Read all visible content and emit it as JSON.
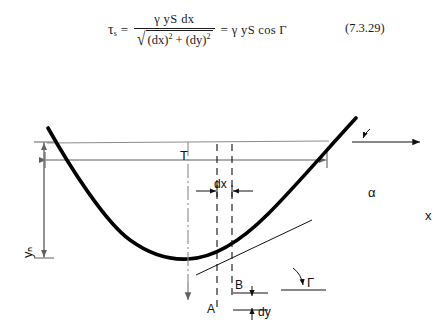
{
  "equation": {
    "lhs_symbol": "τ",
    "lhs_subscript": "s",
    "equals": "=",
    "numerator": "γ yS dx",
    "denominator_radical": "√",
    "denominator_terms": "(dx)² + (dy)²",
    "den_open_a": "(dx)",
    "den_pow_a": "2",
    "den_plus": "+",
    "den_open_b": "(dy)",
    "den_pow_b": "2",
    "equals_2": "=",
    "rhs": "γ yS cos Γ",
    "number": "(7.3.29)"
  },
  "figure": {
    "labels": {
      "top_width": "T",
      "dx": "dx",
      "alpha": "α",
      "x_axis": "x",
      "normal_depth": "yₙ",
      "normal_depth_text": "yN",
      "point_a": "A",
      "point_b": "B",
      "dy": "dy",
      "slope_angle": "Γ",
      "y_axis": "y"
    },
    "colors": {
      "channel_bank": "#000000",
      "water_surface": "#8c8c8c",
      "dimension_line": "#6f6f6f",
      "dashed_line": "#111111",
      "centerline": "#8a8a8a",
      "text": "#111111"
    },
    "geometry": {
      "surface_y": 70,
      "surface_left_x": 47,
      "surface_right_x": 329,
      "channel_bottom_x": 188,
      "channel_bottom_y": 186,
      "dim_T_left_x": 45,
      "dim_T_right_x": 327,
      "dim_T_y": 88,
      "dim_dx_left_x": 217,
      "dim_dx_right_x": 232,
      "dim_dx_y": 119,
      "dim_yN_x": 44,
      "dim_yN_top_y": 70,
      "dim_yN_bottom_y": 186
    }
  }
}
